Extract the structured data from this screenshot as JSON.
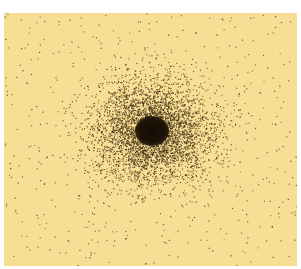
{
  "image": {
    "description": "Stippled dot-density illustration: dense dark core with dots thinning radially outward on pale yellow paper",
    "colors": {
      "page_border": "#ffffff",
      "paper": "#f8dd94",
      "dot": "#3a2a12",
      "core": "#140d05"
    },
    "paper_rect": {
      "x": 4,
      "y": 13,
      "width": 293,
      "height": 253
    },
    "core": {
      "cx": 148,
      "cy": 118,
      "rx": 17,
      "ry": 15
    },
    "halo": {
      "dense_dots": 4200,
      "sigma_x": 30,
      "sigma_y": 26
    },
    "background_dots": 520
  }
}
